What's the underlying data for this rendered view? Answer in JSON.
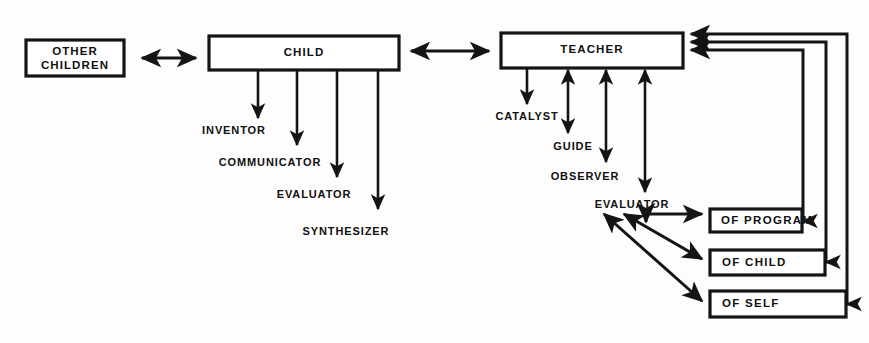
{
  "diagram": {
    "colors": {
      "background": "#fdfdfd",
      "stroke": "#141414",
      "box_fill": "#ffffff",
      "text": "#101010"
    },
    "main_boxes": [
      {
        "id": "other-children",
        "line1": "OTHER",
        "line2": "CHILDREN"
      },
      {
        "id": "child",
        "label": "CHILD"
      },
      {
        "id": "teacher",
        "label": "TEACHER"
      }
    ],
    "child_roles": [
      {
        "label": "INVENTOR"
      },
      {
        "label": "COMMUNICATOR"
      },
      {
        "label": "EVALUATOR"
      },
      {
        "label": "SYNTHESIZER"
      }
    ],
    "teacher_roles": [
      {
        "label": "CATALYST"
      },
      {
        "label": "GUIDE"
      },
      {
        "label": "OBSERVER"
      },
      {
        "label": "EVALUATOR"
      }
    ],
    "evaluation_targets": [
      {
        "label": "OF PROGRAM"
      },
      {
        "label": "OF CHILD"
      },
      {
        "label": "OF SELF"
      }
    ]
  }
}
